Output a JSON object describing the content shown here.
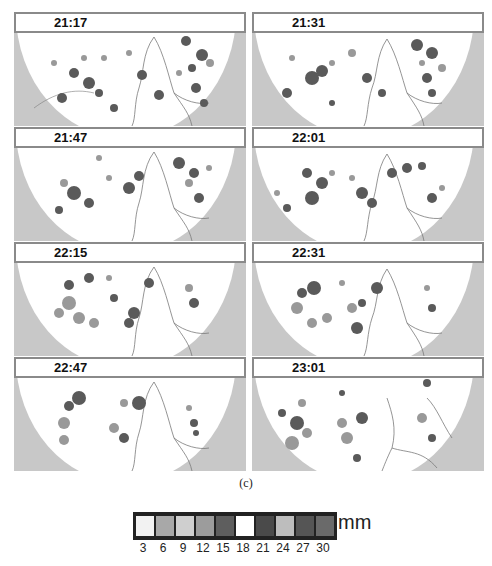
{
  "figure": {
    "panels": [
      {
        "time": "21:17",
        "col": 0,
        "row": 0
      },
      {
        "time": "21:31",
        "col": 1,
        "row": 0
      },
      {
        "time": "21:47",
        "col": 0,
        "row": 1
      },
      {
        "time": "22:01",
        "col": 1,
        "row": 1
      },
      {
        "time": "22:15",
        "col": 0,
        "row": 2
      },
      {
        "time": "22:31",
        "col": 1,
        "row": 2
      },
      {
        "time": "22:47",
        "col": 0,
        "row": 3
      },
      {
        "time": "23:01",
        "col": 1,
        "row": 3
      }
    ],
    "caption": "(c)"
  },
  "legend": {
    "unit": "mm",
    "swatches": [
      {
        "value": "3",
        "color": "#f2f2f2"
      },
      {
        "value": "6",
        "color": "#a8a8a8"
      },
      {
        "value": "9",
        "color": "#cfcfcf"
      },
      {
        "value": "12",
        "color": "#9c9c9c"
      },
      {
        "value": "15",
        "color": "#5e5e5e"
      },
      {
        "value": "18",
        "color": "#ffffff"
      },
      {
        "value": "21",
        "color": "#4a4a4a"
      },
      {
        "value": "24",
        "color": "#bdbdbd"
      },
      {
        "value": "27",
        "color": "#555555"
      },
      {
        "value": "30",
        "color": "#6a6a6a"
      }
    ]
  },
  "colors": {
    "outside_disc": "#c8c8c8",
    "disc": "#ffffff",
    "coastline": "#7a7a7a",
    "rain_dark": "#5a5a5a",
    "rain_mid": "#8e8e8e",
    "rain_light": "#b8b8b8",
    "label_border": "#8a8a8a"
  }
}
